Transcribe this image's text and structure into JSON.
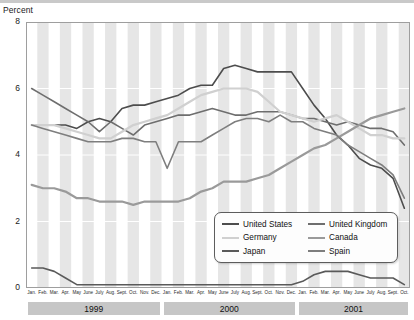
{
  "axis": {
    "y_title": "Percent",
    "y_ticks": [
      0,
      2,
      4,
      6,
      8
    ],
    "x_tick_labels": [
      "Jan.",
      "Feb.",
      "Mar.",
      "Apr.",
      "May",
      "June",
      "July",
      "Aug.",
      "Sept.",
      "Oct.",
      "Nov.",
      "Dec."
    ]
  },
  "year_bands": [
    {
      "label": "1999",
      "start_index": 0,
      "count": 12
    },
    {
      "label": "2000",
      "start_index": 12,
      "count": 12
    },
    {
      "label": "2001",
      "start_index": 24,
      "count": 10
    }
  ],
  "legend": {
    "items": [
      {
        "label": "United States",
        "color": "#4d4d4d"
      },
      {
        "label": "United Kingdom",
        "color": "#6e6e6e"
      },
      {
        "label": "Germany",
        "color": "#d0d0d0"
      },
      {
        "label": "Canada",
        "color": "#9a9a9a"
      },
      {
        "label": "Japan",
        "color": "#5a5a5a"
      },
      {
        "label": "Spain",
        "color": "#7e7e7e"
      }
    ]
  },
  "chart_data": {
    "type": "line",
    "title": "",
    "xlabel": "",
    "ylabel": "Percent",
    "ylim": [
      0,
      8
    ],
    "grid": false,
    "legend_position": "inside-bottom-right",
    "x": [
      "Jan. 1999",
      "Feb. 1999",
      "Mar. 1999",
      "Apr. 1999",
      "May 1999",
      "June 1999",
      "July 1999",
      "Aug. 1999",
      "Sept. 1999",
      "Oct. 1999",
      "Nov. 1999",
      "Dec. 1999",
      "Jan. 2000",
      "Feb. 2000",
      "Mar. 2000",
      "Apr. 2000",
      "May 2000",
      "June 2000",
      "July 2000",
      "Aug. 2000",
      "Sept. 2000",
      "Oct. 2000",
      "Nov. 2000",
      "Dec. 2000",
      "Jan. 2001",
      "Feb. 2001",
      "Mar. 2001",
      "Apr. 2001",
      "May 2001",
      "June 2001",
      "July 2001",
      "Aug. 2001",
      "Sept. 2001",
      "Oct. 2001"
    ],
    "series": [
      {
        "name": "United States",
        "color": "#4d4d4d",
        "values": [
          4.9,
          4.9,
          4.9,
          4.9,
          4.8,
          5.0,
          5.1,
          5.0,
          5.4,
          5.5,
          5.5,
          5.6,
          5.7,
          5.8,
          6.0,
          6.1,
          6.1,
          6.6,
          6.7,
          6.6,
          6.5,
          6.5,
          6.5,
          6.5,
          6.0,
          5.5,
          5.1,
          4.6,
          4.3,
          3.9,
          3.7,
          3.6,
          3.3,
          2.4
        ],
        "width": 1.6
      },
      {
        "name": "United Kingdom",
        "color": "#6e6e6e",
        "values": [
          6.0,
          5.8,
          5.6,
          5.4,
          5.2,
          5.0,
          4.7,
          5.0,
          4.8,
          4.6,
          4.9,
          5.0,
          5.1,
          5.2,
          5.2,
          5.3,
          5.4,
          5.3,
          5.2,
          5.2,
          5.3,
          5.3,
          5.3,
          5.2,
          5.1,
          5.1,
          5.0,
          4.9,
          5.0,
          4.9,
          4.8,
          4.8,
          4.7,
          4.3
        ],
        "width": 1.6
      },
      {
        "name": "Germany",
        "color": "#d0d0d0",
        "values": [
          4.9,
          4.9,
          4.9,
          4.8,
          4.7,
          4.6,
          4.5,
          4.5,
          4.7,
          4.9,
          5.0,
          5.1,
          5.2,
          5.4,
          5.6,
          5.8,
          5.9,
          6.0,
          6.0,
          6.0,
          5.9,
          5.6,
          5.3,
          5.2,
          5.1,
          5.0,
          5.1,
          5.2,
          5.0,
          4.8,
          4.6,
          4.6,
          4.5,
          4.5
        ],
        "width": 2.2
      },
      {
        "name": "Canada",
        "color": "#9a9a9a",
        "values": [
          3.1,
          3.0,
          3.0,
          2.9,
          2.7,
          2.7,
          2.6,
          2.6,
          2.6,
          2.5,
          2.6,
          2.6,
          2.6,
          2.6,
          2.7,
          2.9,
          3.0,
          3.2,
          3.2,
          3.2,
          3.3,
          3.4,
          3.6,
          3.8,
          4.0,
          4.2,
          4.3,
          4.5,
          4.7,
          4.9,
          5.1,
          5.2,
          5.3,
          5.4
        ],
        "width": 2.2
      },
      {
        "name": "Japan",
        "color": "#5a5a5a",
        "values": [
          0.6,
          0.6,
          0.5,
          0.3,
          0.1,
          0.1,
          0.1,
          0.1,
          0.1,
          0.1,
          0.1,
          0.1,
          0.1,
          0.1,
          0.1,
          0.1,
          0.1,
          0.1,
          0.1,
          0.1,
          0.1,
          0.1,
          0.1,
          0.1,
          0.2,
          0.4,
          0.5,
          0.5,
          0.5,
          0.4,
          0.3,
          0.3,
          0.3,
          0.1
        ],
        "width": 1.6
      },
      {
        "name": "Spain",
        "color": "#7e7e7e",
        "values": [
          4.9,
          4.8,
          4.7,
          4.6,
          4.5,
          4.4,
          4.4,
          4.4,
          4.5,
          4.5,
          4.4,
          4.4,
          3.6,
          4.4,
          4.4,
          4.4,
          4.6,
          4.8,
          5.0,
          5.1,
          5.1,
          5.0,
          5.2,
          5.0,
          5.0,
          4.8,
          4.7,
          4.6,
          4.3,
          4.1,
          3.9,
          3.7,
          3.4,
          2.7
        ],
        "width": 1.6
      }
    ]
  }
}
